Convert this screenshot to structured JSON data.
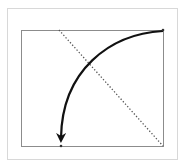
{
  "diagram": {
    "type": "rotation-arrow-illustration",
    "colors": {
      "outer_frame": "#d8d8d8",
      "inner_box": "#8c8c8c",
      "diagonal": "#555555",
      "arrow": "#111111"
    },
    "inner_box": {
      "x": 21,
      "y": 30,
      "width": 142,
      "height": 116
    },
    "diagonal": {
      "x1": 59,
      "y1": 30,
      "x2": 163,
      "y2": 146,
      "style": "dotted"
    },
    "arrow": {
      "from": [
        163,
        30
      ],
      "to": [
        61,
        140
      ],
      "curve": "counter-clockwise arc"
    },
    "points": [
      {
        "name": "start-point",
        "x": 163,
        "y": 30
      },
      {
        "name": "end-point",
        "x": 61,
        "y": 146
      }
    ]
  }
}
